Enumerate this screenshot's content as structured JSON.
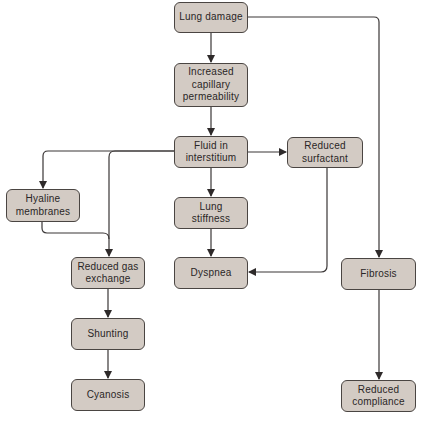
{
  "nodes": {
    "lung_damage": {
      "label": "Lung damage"
    },
    "capillary_permeability": {
      "label": "Increased\ncapillary\npermeability"
    },
    "fluid_interstitium": {
      "label": "Fluid in\ninterstitium"
    },
    "reduced_surfactant": {
      "label": "Reduced\nsurfactant"
    },
    "hyaline_membranes": {
      "label": "Hyaline\nmembranes"
    },
    "lung_stiffness": {
      "label": "Lung\nstiffness"
    },
    "dyspnea": {
      "label": "Dyspnea"
    },
    "reduced_gas_exchange": {
      "label": "Reduced gas\nexchange"
    },
    "shunting": {
      "label": "Shunting"
    },
    "cyanosis": {
      "label": "Cyanosis"
    },
    "fibrosis": {
      "label": "Fibrosis"
    },
    "reduced_compliance": {
      "label": "Reduced\ncompliance"
    }
  },
  "edges": [
    {
      "from": "Lung damage",
      "to": "Increased capillary permeability"
    },
    {
      "from": "Lung damage",
      "to": "Fibrosis"
    },
    {
      "from": "Increased capillary permeability",
      "to": "Fluid in interstitium"
    },
    {
      "from": "Fluid in interstitium",
      "to": "Reduced surfactant"
    },
    {
      "from": "Fluid in interstitium",
      "to": "Hyaline membranes"
    },
    {
      "from": "Fluid in interstitium",
      "to": "Reduced gas exchange"
    },
    {
      "from": "Fluid in interstitium",
      "to": "Lung stiffness"
    },
    {
      "from": "Hyaline membranes",
      "to": "Reduced gas exchange"
    },
    {
      "from": "Lung stiffness",
      "to": "Dyspnea"
    },
    {
      "from": "Reduced surfactant",
      "to": "Dyspnea"
    },
    {
      "from": "Reduced gas exchange",
      "to": "Shunting"
    },
    {
      "from": "Shunting",
      "to": "Cyanosis"
    },
    {
      "from": "Fibrosis",
      "to": "Reduced compliance"
    }
  ],
  "colors": {
    "node_fill": "#d3cbc4",
    "node_border": "#4a4542",
    "edge": "#3a3636"
  }
}
